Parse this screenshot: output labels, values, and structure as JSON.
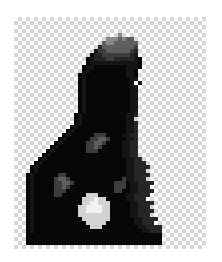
{
  "image": {
    "title": "Pixelated dark figure silhouette",
    "subject": "hooded-figure",
    "alt_text": "Low-resolution grayscale silhouette of a hooded figure on a transparency checkerboard background",
    "width": 222,
    "height": 262,
    "background_style": "transparency-checkerboard",
    "render_mode": "pixelated"
  },
  "canvas": {
    "left": 14,
    "top": 17,
    "width": 192,
    "height": 232,
    "grid_cols": 48,
    "grid_rows": 58,
    "cell_size": 4
  },
  "checkerboard": {
    "cell_size": 4,
    "color_light": "#ffffff",
    "color_dark": "#d6d6d6"
  },
  "palette": {
    "transparent": null,
    "black": "#070707",
    "near_black": "#151515",
    "dark": "#262626",
    "mid_dark": "#3d3d3d",
    "mid": "#5e5e5e",
    "mid_light": "#8a8a8a",
    "light": "#b4b4b4",
    "bright": "#d2d2d2",
    "white": "#f2f2f2"
  },
  "figure": {
    "name": "hooded-figure",
    "parts": [
      {
        "name": "head-dome",
        "shade": "black"
      },
      {
        "name": "head-cap-highlight",
        "shade": "mid"
      },
      {
        "name": "neck",
        "shade": "black"
      },
      {
        "name": "left-shoulder",
        "shade": "black"
      },
      {
        "name": "right-shoulder",
        "shade": "black"
      },
      {
        "name": "torso",
        "shade": "black"
      },
      {
        "name": "base-bar",
        "shade": "black"
      },
      {
        "name": "chest-speckles",
        "shade": "mid_dark"
      },
      {
        "name": "left-speckle-cluster",
        "shade": "mid"
      },
      {
        "name": "right-speckle-cluster",
        "shade": "mid_dark"
      },
      {
        "name": "badge-blob",
        "shade": "bright"
      },
      {
        "name": "badge-eye-left",
        "shade": "white"
      },
      {
        "name": "badge-eye-right",
        "shade": "white"
      }
    ]
  },
  "pixel_map": {
    "comment": "Row-major grid, 48 cols x 58 rows. Characters map to palette keys: '.'=transparent, '9'=white, '8'=bright, '7'=light, '6'=mid_light, '5'=mid, '4'=mid_dark, '3'=dark, '2'=near_black, '1'=black",
    "rows": [
      "................................................",
      "................................................",
      "................................................",
      "................................................",
      "..........................6.....................",
      ".......................6665655..................",
      "......................566555555.................",
      ".....................3555555554.................",
      "....................24455555543.................",
      "...................133444444432.................",
      "..................12333443333321................",
      "..................12222222222221................",
      ".................122111111112221................",
      ".................12111111111221.................",
      "................121111111111221.................",
      "................121111111111122.................",
      "................12111111111112 2................",
      "................121111111111122.................",
      "................121111111111122.................",
      "................121111111111122.................",
      "................121111111111122.................",
      "................121111111111122.................",
      "................121111111111122.................",
      "................121111111111122.................",
      "...............1211111111111223.................",
      "...............121111111111122..................",
      "...............1211111111111223.................",
      "..............12111111111111223.................",
      ".............121111111111111223.................",
      "............1211111144411112233.................",
      "...........12111111445541111223.................",
      "..........121111114455411112233.................",
      ".........1211111114454111112233.................",
      "........12111111114441111112233.................",
      ".......121111111111111111112233.................",
      "......12111111111111111111112233................",
      ".....1211111111111111111111122333...............",
      "....121111111111111111111111223333..............",
      "....12111111111111111111111122333...............",
      "...1211111144111111111111111223333..............",
      "...121111145541111111111111422333...............",
      "...12111114455411111111114441223333.............",
      "...1211111445411111111111444122333..............",
      "...12111114441111111111114411223333.............",
      "...1211111441111118881111111223333..............",
      "...121111111111118889881111122333...............",
      "...12111111111111889988811111223333.............",
      "...1211111111111889999881111122333..............",
      "...12111111111118899998811111223333.............",
      "...1211111111111888888881111122333..............",
      "...121111111111118888888111111223333............",
      "...12111111111111188888111111122333.............",
      "...1211111111111111888111111111223333...........",
      "...1211111111111111111111111111122333...........",
      "...1111111111111111111111111111111111...........",
      "...1111111111111111111111111111111111...........",
      "...1111111111111111111111111111111111...........",
      "................................................"
    ]
  }
}
